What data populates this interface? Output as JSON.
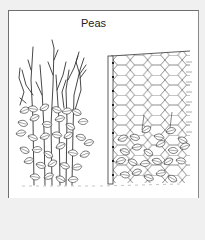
{
  "illustration": {
    "title": "Peas",
    "left_figure": "pea-plants-supported-by-twig-sticks",
    "right_figure": "pea-plants-climbing-hexagonal-wire-netting-on-post",
    "colors": {
      "background": "#f0f0f0",
      "panel": "#ffffff",
      "border": "#6f6f6f",
      "ink": "#333333"
    }
  }
}
